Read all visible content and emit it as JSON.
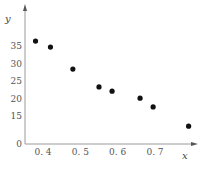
{
  "chart_data": {
    "type": "scatter",
    "title": "",
    "xlabel": "x",
    "ylabel": "y",
    "xlim": [
      0.35,
      0.82
    ],
    "ylim": [
      0,
      40
    ],
    "x_axis_break": true,
    "y_axis_break": true,
    "grid": false,
    "legend": "none",
    "x_ticks": [
      0.4,
      0.5,
      0.6,
      0.7
    ],
    "x_tick_labels": [
      "0. 4",
      "0. 5",
      "0. 6",
      "0. 7"
    ],
    "y_ticks": [
      0,
      15,
      20,
      25,
      30,
      35
    ],
    "y_tick_labels": [
      "0",
      "15",
      "20",
      "25",
      "30",
      "35"
    ],
    "series": [
      {
        "name": "points",
        "color": "#111111",
        "points": [
          {
            "x": 0.38,
            "y": 36.4
          },
          {
            "x": 0.42,
            "y": 34.7
          },
          {
            "x": 0.48,
            "y": 28.4
          },
          {
            "x": 0.55,
            "y": 23.3
          },
          {
            "x": 0.585,
            "y": 22.1
          },
          {
            "x": 0.66,
            "y": 20.1
          },
          {
            "x": 0.695,
            "y": 17.6
          },
          {
            "x": 0.79,
            "y": 12.1
          }
        ]
      }
    ]
  }
}
